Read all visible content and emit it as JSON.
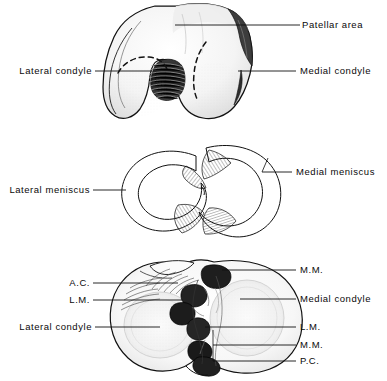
{
  "figure": {
    "background_color": "#ffffff",
    "ink_color": "#111111",
    "panels": [
      {
        "id": "panel-femoral-condyles",
        "name": "distal-femur-inferior-view",
        "labels": [
          {
            "key": "patellar_area",
            "text": "Patellar area",
            "side": "right"
          },
          {
            "key": "lateral_condyle",
            "text": "Lateral condyle",
            "side": "left"
          },
          {
            "key": "medial_condyle",
            "text": "Medial condyle",
            "side": "right"
          }
        ]
      },
      {
        "id": "panel-menisci",
        "name": "menisci-superior-view",
        "labels": [
          {
            "key": "lateral_meniscus",
            "text": "Lateral meniscus",
            "side": "left"
          },
          {
            "key": "medial_meniscus",
            "text": "Medial meniscus",
            "side": "right"
          }
        ]
      },
      {
        "id": "panel-tibial-plateau",
        "name": "tibial-plateau-superior-view",
        "labels": [
          {
            "key": "ac",
            "text": "A.C.",
            "side": "left"
          },
          {
            "key": "lm_left",
            "text": "L.M.",
            "side": "left"
          },
          {
            "key": "lateral_condyle_tibia",
            "text": "Lateral condyle",
            "side": "left"
          },
          {
            "key": "mm_top",
            "text": "M.M.",
            "side": "right"
          },
          {
            "key": "medial_condyle_tibia",
            "text": "Medial condyle",
            "side": "right"
          },
          {
            "key": "lm_right",
            "text": "L.M.",
            "side": "right"
          },
          {
            "key": "mm_bottom",
            "text": "M.M.",
            "side": "right"
          },
          {
            "key": "pc",
            "text": "P.C.",
            "side": "right"
          }
        ]
      }
    ]
  },
  "labels": {
    "patellar_area": "Patellar area",
    "lateral_condyle_femur": "Lateral condyle",
    "medial_condyle_femur": "Medial condyle",
    "lateral_meniscus": "Lateral meniscus",
    "medial_meniscus": "Medial meniscus",
    "ac": "A.C.",
    "lm_left": "L.M.",
    "lateral_condyle_tibia": "Lateral condyle",
    "mm_top": "M.M.",
    "medial_condyle_tibia": "Medial condyle",
    "lm_right": "L.M.",
    "mm_bottom": "M.M.",
    "pc": "P.C."
  }
}
